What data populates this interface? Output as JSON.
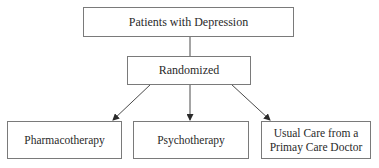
{
  "diagram": {
    "type": "flowchart",
    "nodes": {
      "root": {
        "label": "Patients with Depression"
      },
      "randomized": {
        "label": "Randomized"
      },
      "pharmacotherapy": {
        "label": "Pharmacotherapy"
      },
      "psychotherapy": {
        "label": "Psychotherapy"
      },
      "usual_care": {
        "label": "Usual Care from a\nPrimay Care Doctor"
      }
    },
    "edges": [
      {
        "from": "root",
        "to": "randomized",
        "arrow": false
      },
      {
        "from": "randomized",
        "to": "pharmacotherapy",
        "arrow": true
      },
      {
        "from": "randomized",
        "to": "psychotherapy",
        "arrow": true
      },
      {
        "from": "randomized",
        "to": "usual_care",
        "arrow": true
      }
    ],
    "colors": {
      "border": "#7a7a7a",
      "line": "#4a4a4a",
      "text": "#2a2a2a",
      "background": "#ffffff"
    }
  }
}
